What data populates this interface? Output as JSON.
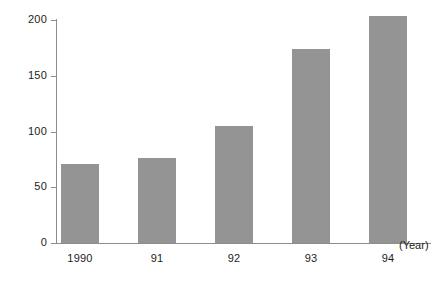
{
  "chart_data": {
    "type": "bar",
    "title": "",
    "subtitle": "",
    "xlabel": "(Year)",
    "ylabel": "",
    "categories": [
      "1990",
      "91",
      "92",
      "93",
      "94"
    ],
    "values": [
      71,
      76,
      105,
      174,
      204
    ],
    "series": [
      {
        "name": "",
        "values": [
          71,
          76,
          105,
          174,
          204
        ]
      }
    ],
    "ylim": [
      0,
      200
    ],
    "y_ticks": [
      0,
      50,
      100,
      150,
      200
    ],
    "y_tick_labels": [
      "0",
      "50",
      "100",
      "150",
      "200"
    ],
    "x_tick_labels": [
      "1990",
      "91",
      "92",
      "93",
      "94"
    ],
    "grid": false,
    "legend": null,
    "legend_position": "none",
    "annotations": [
      {
        "text": "(Year)",
        "position": "x-axis-end-right"
      }
    ],
    "bar_color": "#949494",
    "axis_color": "#8d8d8d",
    "background_color": "#ffffff",
    "text_color": "#1d1d1d"
  }
}
